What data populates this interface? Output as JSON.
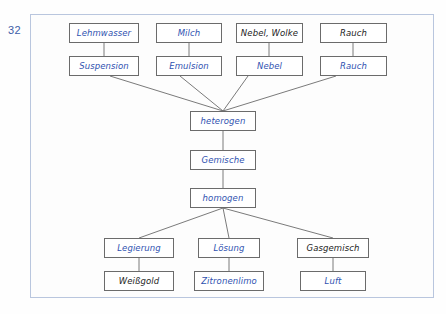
{
  "page": {
    "number": "32",
    "colors": {
      "handwriting_blue": "#2f52b0",
      "handwriting_black": "#1c1c1c",
      "frame_border": "#b9c6de",
      "box_border": "#6b6b6b",
      "background": "#fdfdfd"
    }
  },
  "diagram": {
    "nodes": {
      "lehmwasser": {
        "label": "Lehmwasser",
        "color": "blue",
        "x": 69,
        "y": 23,
        "w": 70,
        "h": 20
      },
      "milch": {
        "label": "Milch",
        "color": "blue",
        "x": 156,
        "y": 23,
        "w": 66,
        "h": 20
      },
      "nebel_wolke": {
        "label": "Nebel, Wolke",
        "color": "black",
        "x": 236,
        "y": 23,
        "w": 67,
        "h": 20
      },
      "rauch_top": {
        "label": "Rauch",
        "color": "black",
        "x": 320,
        "y": 23,
        "w": 67,
        "h": 20
      },
      "suspension": {
        "label": "Suspension",
        "color": "blue",
        "x": 69,
        "y": 56,
        "w": 70,
        "h": 20
      },
      "emulsion": {
        "label": "Emulsion",
        "color": "blue",
        "x": 156,
        "y": 56,
        "w": 66,
        "h": 20
      },
      "nebel": {
        "label": "Nebel",
        "color": "blue",
        "x": 236,
        "y": 56,
        "w": 67,
        "h": 20
      },
      "rauch_mid": {
        "label": "Rauch",
        "color": "blue",
        "x": 320,
        "y": 56,
        "w": 67,
        "h": 20
      },
      "heterogen": {
        "label": "heterogen",
        "color": "blue",
        "x": 190,
        "y": 111,
        "w": 66,
        "h": 20
      },
      "gemische": {
        "label": "Gemische",
        "color": "blue",
        "x": 190,
        "y": 150,
        "w": 66,
        "h": 20
      },
      "homogen": {
        "label": "homogen",
        "color": "blue",
        "x": 190,
        "y": 188,
        "w": 66,
        "h": 20
      },
      "legierung": {
        "label": "Legierung",
        "color": "blue",
        "x": 104,
        "y": 238,
        "w": 70,
        "h": 20
      },
      "loesung": {
        "label": "Lösung",
        "color": "blue",
        "x": 198,
        "y": 238,
        "w": 62,
        "h": 20
      },
      "gasgemisch": {
        "label": "Gasgemisch",
        "color": "black",
        "x": 297,
        "y": 238,
        "w": 72,
        "h": 20
      },
      "weissgold": {
        "label": "Weißgold",
        "color": "black",
        "x": 104,
        "y": 271,
        "w": 70,
        "h": 20
      },
      "zitronenlimo": {
        "label": "Zitronenlimo",
        "color": "blue",
        "x": 194,
        "y": 271,
        "w": 70,
        "h": 20
      },
      "luft": {
        "label": "Luft",
        "color": "blue",
        "x": 300,
        "y": 271,
        "w": 66,
        "h": 20
      }
    },
    "edges": [
      {
        "name": "lehmwasser-suspension",
        "x1": 104,
        "y1": 43,
        "x2": 104,
        "y2": 56
      },
      {
        "name": "milch-emulsion",
        "x1": 189,
        "y1": 43,
        "x2": 189,
        "y2": 56
      },
      {
        "name": "nebelwolke-nebel",
        "x1": 269,
        "y1": 43,
        "x2": 269,
        "y2": 56
      },
      {
        "name": "rauchtop-rauchmid",
        "x1": 353,
        "y1": 43,
        "x2": 353,
        "y2": 56
      },
      {
        "name": "suspension-heterogen",
        "x1": 110,
        "y1": 76,
        "x2": 223,
        "y2": 111
      },
      {
        "name": "emulsion-heterogen",
        "x1": 180,
        "y1": 76,
        "x2": 223,
        "y2": 111
      },
      {
        "name": "nebel-heterogen",
        "x1": 248,
        "y1": 76,
        "x2": 223,
        "y2": 111
      },
      {
        "name": "rauch-heterogen",
        "x1": 336,
        "y1": 76,
        "x2": 223,
        "y2": 111
      },
      {
        "name": "heterogen-gemische",
        "x1": 223,
        "y1": 131,
        "x2": 223,
        "y2": 150
      },
      {
        "name": "gemische-homogen",
        "x1": 223,
        "y1": 170,
        "x2": 223,
        "y2": 188
      },
      {
        "name": "homogen-legierung",
        "x1": 223,
        "y1": 208,
        "x2": 139,
        "y2": 238
      },
      {
        "name": "homogen-loesung",
        "x1": 223,
        "y1": 208,
        "x2": 229,
        "y2": 238
      },
      {
        "name": "homogen-gasgemisch",
        "x1": 223,
        "y1": 208,
        "x2": 333,
        "y2": 238
      },
      {
        "name": "legierung-weissgold",
        "x1": 139,
        "y1": 258,
        "x2": 139,
        "y2": 271
      },
      {
        "name": "loesung-zitronenlimo",
        "x1": 229,
        "y1": 258,
        "x2": 229,
        "y2": 271
      },
      {
        "name": "gasgemisch-luft",
        "x1": 333,
        "y1": 258,
        "x2": 333,
        "y2": 271
      }
    ]
  }
}
